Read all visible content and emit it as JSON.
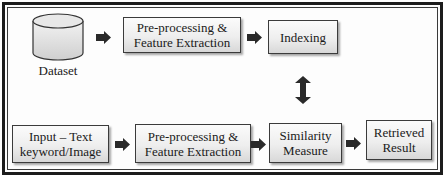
{
  "diagram": {
    "type": "flowchart",
    "title": "",
    "top_row": {
      "dataset": {
        "label": "Dataset",
        "icon": "database-cylinder-icon"
      },
      "preprocessing": {
        "line1": "Pre-processing &",
        "line2": "Feature Extraction"
      },
      "indexing": {
        "label": "Indexing"
      }
    },
    "bottom_row": {
      "input": {
        "line1": "Input – Text",
        "line2": "keyword/Image"
      },
      "preprocessing": {
        "line1": "Pre-processing &",
        "line2": "Feature Extraction"
      },
      "similarity": {
        "line1": "Similarity",
        "line2": "Measure"
      },
      "result": {
        "line1": "Retrieved",
        "line2": "Result"
      }
    },
    "edges": [
      {
        "from": "Dataset",
        "to": "Pre-processing & Feature Extraction (top)",
        "style": "right-arrow"
      },
      {
        "from": "Pre-processing & Feature Extraction (top)",
        "to": "Indexing",
        "style": "right-arrow"
      },
      {
        "from": "Indexing",
        "to": "Similarity Measure",
        "style": "double-headed-vertical-arrow"
      },
      {
        "from": "Input – Text keyword/Image",
        "to": "Pre-processing & Feature Extraction (bottom)",
        "style": "right-arrow"
      },
      {
        "from": "Pre-processing & Feature Extraction (bottom)",
        "to": "Similarity Measure",
        "style": "right-arrow"
      },
      {
        "from": "Similarity Measure",
        "to": "Retrieved Result",
        "style": "right-arrow"
      }
    ],
    "colors": {
      "border": "#1c1c1c",
      "box_fill_top": "#fbfbfb",
      "box_fill_bottom": "#d8d8d8",
      "arrow": "#2a2a2a"
    }
  }
}
